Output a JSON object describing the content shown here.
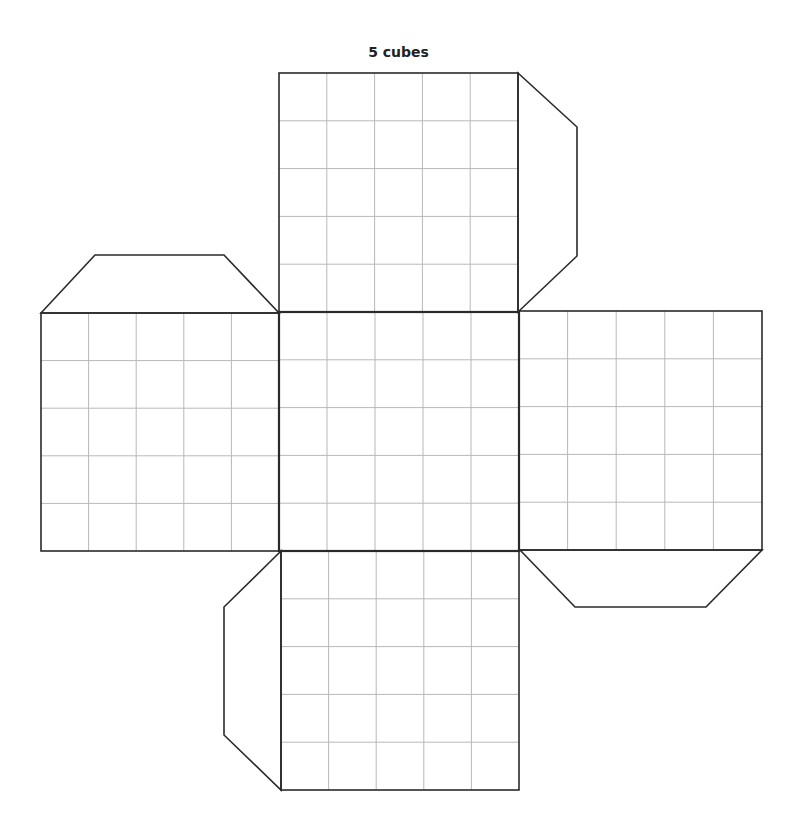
{
  "title": "5 cubes",
  "net": {
    "description": "Cube net: 5x5 grid squares per face, cross-shaped with trapezoid glue tabs",
    "grid_divisions": 5,
    "colors": {
      "outline": "#2a2a2a",
      "grid": "#b8b8b8",
      "background": "#ffffff"
    },
    "faces": [
      {
        "name": "top",
        "x": 279,
        "y": 73,
        "w": 239,
        "h": 239
      },
      {
        "name": "left",
        "x": 41,
        "y": 313,
        "w": 238,
        "h": 238
      },
      {
        "name": "center",
        "x": 279,
        "y": 312,
        "w": 240,
        "h": 239
      },
      {
        "name": "right",
        "x": 519,
        "y": 311,
        "w": 243,
        "h": 239
      },
      {
        "name": "bottom",
        "x": 281,
        "y": 551,
        "w": 238,
        "h": 239
      }
    ],
    "tabs": [
      {
        "name": "top-right-tab",
        "points": "518,73 577,127 577,256 518,312"
      },
      {
        "name": "left-top-tab",
        "points": "41,313 95,255 224,255 279,313"
      },
      {
        "name": "right-bottom-tab",
        "points": "520,550 575,607 706,607 762,550"
      },
      {
        "name": "bottom-left-tab",
        "points": "281,551 224,607 224,735 281,790"
      }
    ]
  }
}
